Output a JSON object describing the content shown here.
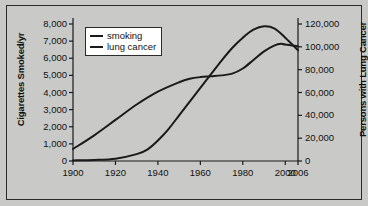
{
  "chart_data": {
    "type": "line",
    "title": "",
    "xlabel": "",
    "ylabel": "Cigarettes Smoked/yr",
    "y2label": "Persons with Lung Cancer",
    "xlim": [
      1900,
      2006
    ],
    "ylim": [
      0,
      8000
    ],
    "y2lim": [
      0,
      120000
    ],
    "grid": false,
    "legend_position": "upper-left-inside",
    "xticks": [
      1900,
      1920,
      1940,
      1960,
      1980,
      2000,
      2006
    ],
    "xtick_labels": [
      "1900",
      "1920",
      "1940",
      "1960",
      "1980",
      "2000",
      "2006"
    ],
    "yticks": [
      0,
      1000,
      2000,
      3000,
      4000,
      5000,
      6000,
      7000,
      8000
    ],
    "ytick_labels": [
      "0",
      "1,000",
      "2,000",
      "3,000",
      "4,000",
      "5,000",
      "6,000",
      "7,000",
      "8,000"
    ],
    "y2ticks": [
      0,
      20000,
      40000,
      60000,
      80000,
      100000,
      120000
    ],
    "y2tick_labels": [
      "0",
      "20,000",
      "40,000",
      "60,000",
      "80,000",
      "100,000",
      "120,000"
    ],
    "series": [
      {
        "name": "smoking",
        "axis": "left",
        "color": "#1a1a1a",
        "x": [
          1900,
          1910,
          1920,
          1930,
          1940,
          1950,
          1955,
          1960,
          1965,
          1970,
          1975,
          1980,
          1985,
          1990,
          1995,
          1998,
          2000,
          2006
        ],
        "values": [
          700,
          1500,
          2400,
          3300,
          4050,
          4600,
          4800,
          4900,
          4950,
          5000,
          5100,
          5400,
          5900,
          6400,
          6750,
          6850,
          6800,
          6700
        ]
      },
      {
        "name": "lung cancer",
        "axis": "right",
        "color": "#1a1a1a",
        "x": [
          1900,
          1910,
          1920,
          1930,
          1935,
          1940,
          1945,
          1950,
          1955,
          1960,
          1965,
          1970,
          1975,
          1980,
          1985,
          1990,
          1995,
          2000,
          2006
        ],
        "values": [
          500,
          900,
          2000,
          6000,
          10000,
          18000,
          28000,
          40000,
          52000,
          64000,
          76000,
          88000,
          99000,
          108000,
          115000,
          118000,
          116000,
          108000,
          97000
        ]
      }
    ]
  },
  "legend": {
    "items": [
      {
        "label": "smoking"
      },
      {
        "label": "lung cancer"
      }
    ]
  },
  "axes": {
    "left_title": "Cigarettes Smoked/yr",
    "right_title": "Persons with Lung Cancer"
  }
}
